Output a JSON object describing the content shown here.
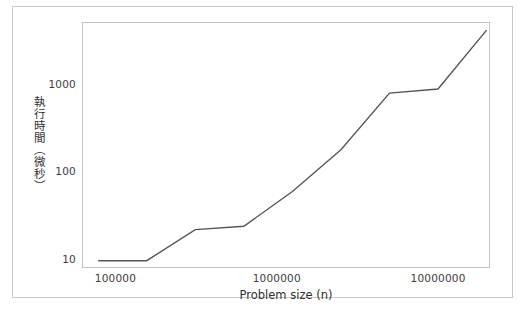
{
  "figure": {
    "background_color": "#ffffff",
    "frame_color": "#c9c9c9",
    "plot_frame_color": "#c2c2c2",
    "line_color": "#555555",
    "tick_text_color": "#3d3d3d",
    "axis_label_color": "#2f2f2f",
    "bottom_caption": ""
  },
  "chart_data": {
    "type": "line",
    "title": "",
    "xlabel": "Problem size (n)",
    "ylabel": "執行時間（微秒）",
    "xscale": "log",
    "yscale": "log",
    "xlim": [
      62000,
      21000000
    ],
    "ylim": [
      8.0,
      5200
    ],
    "grid": false,
    "legend": null,
    "xticks": [
      100000,
      1000000,
      10000000
    ],
    "xtick_labels": [
      "100000",
      "1000000",
      "10000000"
    ],
    "yticks": [
      10,
      100,
      1000
    ],
    "ytick_labels": [
      "10",
      "100",
      "1000"
    ],
    "series": [
      {
        "name": "execution time",
        "color": "#555555",
        "linewidth": 1.4,
        "x": [
          78125,
          156250,
          312500,
          625000,
          1250000,
          2500000,
          5000000,
          10000000,
          20000000
        ],
        "y": [
          9.7,
          9.7,
          22,
          24,
          60,
          180,
          800,
          890,
          4200
        ]
      }
    ]
  }
}
